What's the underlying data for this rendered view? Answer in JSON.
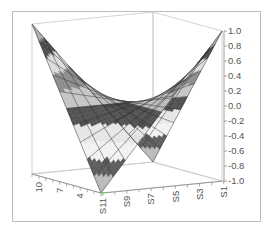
{
  "chart_data": {
    "type": "surface3d",
    "title": "",
    "z_axis": {
      "range": [
        -1.0,
        1.0
      ],
      "ticks": [
        "1.0",
        "0.8",
        "0.6",
        "0.4",
        "0.2",
        "0.0",
        "-0.2",
        "-0.4",
        "-0.6",
        "-0.8",
        "-1.0"
      ]
    },
    "x_axis": {
      "label": "",
      "ticks": [
        "S11",
        "S9",
        "S7",
        "S5",
        "S3",
        "S1"
      ],
      "series_count": 11
    },
    "y_axis": {
      "label": "",
      "ticks": [
        "4",
        "7",
        "10"
      ],
      "range": [
        1,
        11
      ]
    },
    "surface": {
      "description": "Saddle surface: peaks (z=1.0) at the back-left and back-right corners, troughs (z=-1.0) toward front-left and front-right, z=0 along the diagonals",
      "function": "z = x^2 - y^2 (normalized to [-1, 1])",
      "grid_size": [
        11,
        11
      ]
    },
    "band_colors": [
      {
        "range": [
          0.8,
          1.0
        ],
        "color": "#a8a8a8"
      },
      {
        "range": [
          0.6,
          0.8
        ],
        "color": "#4a4a4a"
      },
      {
        "range": [
          0.4,
          0.6
        ],
        "color": "#dcdcdc"
      },
      {
        "range": [
          0.2,
          0.4
        ],
        "color": "#8c8c8c"
      },
      {
        "range": [
          0.0,
          0.2
        ],
        "color": "#c4c4c4"
      },
      {
        "range": [
          -0.2,
          0.0
        ],
        "color": "#505050"
      },
      {
        "range": [
          -0.4,
          -0.2
        ],
        "color": "#e6e6e6"
      },
      {
        "range": [
          -0.6,
          -0.4
        ],
        "color": "#f2f2f2"
      },
      {
        "range": [
          -0.8,
          -0.6
        ],
        "color": "#5c5c5c"
      },
      {
        "range": [
          -1.0,
          -0.8
        ],
        "color": "#bababa"
      }
    ],
    "grid_lines": true,
    "legend": "none"
  }
}
